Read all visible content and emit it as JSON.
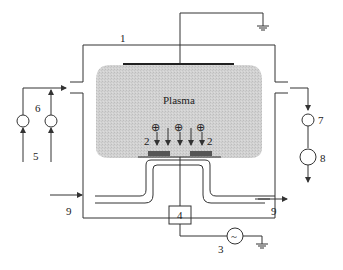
{
  "diagram": {
    "plasma_label": "Plasma",
    "labels": {
      "chamber": "1",
      "substrate_left": "2",
      "substrate_right": "2",
      "rf_source": "3",
      "matching_box": "4",
      "gas_inlet": "5",
      "flow_meter": "6",
      "valve": "7",
      "pump": "8",
      "coolant_in": "9",
      "coolant_out": "9"
    },
    "ion_symbol": "⊕",
    "ac_symbol": "~",
    "colors": {
      "line": "#333333",
      "plasma_fill": "#cfcfcf",
      "background": "#ffffff"
    }
  }
}
